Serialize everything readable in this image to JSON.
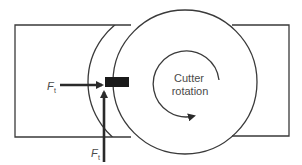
{
  "figure": {
    "type": "milling cutter force diagram",
    "labels": {
      "rotation_line1": "Cutter",
      "rotation_line2": "rotation",
      "force_horizontal": {
        "symbol": "F",
        "subscript": "t"
      },
      "force_vertical": {
        "symbol": "F",
        "subscript": "t"
      }
    },
    "colors": {
      "line": "#3a3a3a",
      "tooth": "#1a1a1a",
      "text": "#4a4a4a",
      "background": "#ffffff"
    }
  }
}
